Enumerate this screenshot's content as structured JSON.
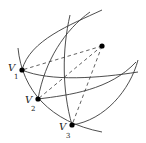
{
  "diagram": {
    "type": "geometric-construction",
    "points": [
      {
        "id": "v1",
        "label": "V",
        "subscript": "1",
        "x": 22,
        "y": 70
      },
      {
        "id": "v2",
        "label": "V",
        "subscript": "2",
        "x": 38,
        "y": 99
      },
      {
        "id": "v3",
        "label": "V",
        "subscript": "3",
        "x": 72,
        "y": 125
      },
      {
        "id": "p",
        "label": "",
        "subscript": "",
        "x": 102,
        "y": 46
      }
    ],
    "dashed_edges": [
      [
        "p",
        "v1"
      ],
      [
        "p",
        "v2"
      ],
      [
        "p",
        "v3"
      ]
    ],
    "colors": {
      "stroke": "#3a3a3a",
      "point": "#000000",
      "background": "#ffffff"
    }
  }
}
